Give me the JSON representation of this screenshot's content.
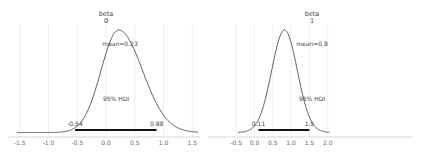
{
  "chart_data": [
    {
      "type": "line",
      "title": "beta\n0",
      "title_line1": "beta",
      "title_line2": "0",
      "mean_label": "mean=0.23",
      "hdi_label": "95% HDI",
      "hdi_low_label": "-0.54",
      "hdi_high_label": "0.88",
      "hdi": [
        -0.54,
        0.88
      ],
      "mean": 0.23,
      "xticks": [
        -1.5,
        -1.0,
        -0.5,
        0.0,
        0.5,
        1.0,
        1.5
      ],
      "xtick_labels": [
        "-1.5",
        "-1.0",
        "-0.5",
        "0.0",
        "0.5",
        "1.0",
        "1.5"
      ],
      "xlim": [
        -1.6,
        1.6
      ],
      "grid": true,
      "kde_peak_x": 0.22,
      "kde_sd": 0.36
    },
    {
      "type": "line",
      "title": "beta\n1",
      "title_line1": "beta",
      "title_line2": "1",
      "mean_label": "mean=0.8",
      "hdi_label": "95% HDI",
      "hdi_low_label": "0.11",
      "hdi_high_label": "1.5",
      "hdi": [
        0.11,
        1.5
      ],
      "mean": 0.8,
      "xticks": [
        -0.5,
        0.0,
        0.5,
        1.0,
        1.5,
        2.0
      ],
      "xtick_labels": [
        "-0.5",
        "0.0",
        "0.5",
        "1.0",
        "1.5",
        "2.0"
      ],
      "xlim": [
        -0.55,
        2.1
      ],
      "grid": true,
      "kde_peak_x": 0.82,
      "kde_sd": 0.35
    }
  ]
}
